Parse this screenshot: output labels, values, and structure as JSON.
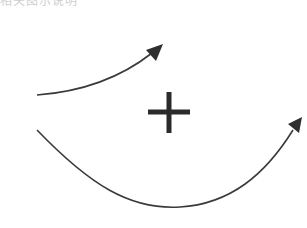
{
  "header": {
    "cropped_text": "相关图示说明"
  },
  "diagram": {
    "stroke_color": "#3a3a3a",
    "plus_color": "#2b2b2b",
    "elements": [
      {
        "name": "upper-curved-arrow",
        "from": [
          37,
          95
        ],
        "to": [
          163,
          44
        ]
      },
      {
        "name": "plus-sign",
        "center": [
          169,
          112
        ]
      },
      {
        "name": "lower-curved-arrow",
        "from": [
          37,
          128
        ],
        "to": [
          302,
          118
        ]
      }
    ]
  }
}
